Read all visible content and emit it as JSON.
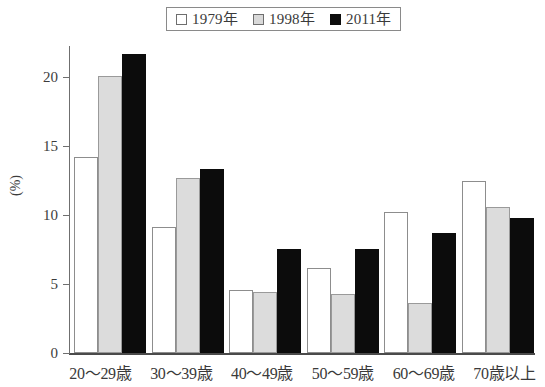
{
  "legend": {
    "position": "top-center",
    "entries": [
      {
        "label": "1979年",
        "swatch": "white-square-icon",
        "color": "#ffffff"
      },
      {
        "label": "1998年",
        "swatch": "gray-square-icon",
        "color": "#dcdcdc"
      },
      {
        "label": "2011年",
        "swatch": "black-square-icon",
        "color": "#0c0c0c"
      }
    ]
  },
  "axes": {
    "y_title": "(%)",
    "y_ticks": [
      "0",
      "5",
      "10",
      "15",
      "20"
    ],
    "x_labels": [
      "20〜29歳",
      "30〜39歳",
      "40〜49歳",
      "50〜59歳",
      "60〜69歳",
      "70歳以上"
    ]
  },
  "chart_data": {
    "type": "bar",
    "title": "",
    "xlabel": "",
    "ylabel": "(%)",
    "ylim": [
      0,
      22.5
    ],
    "yticks": [
      0,
      5,
      10,
      15,
      20
    ],
    "grid": false,
    "legend_position": "top-center",
    "categories": [
      "20〜29歳",
      "30〜39歳",
      "40〜49歳",
      "50〜59歳",
      "60〜69歳",
      "70歳以上"
    ],
    "series": [
      {
        "name": "1979年",
        "color": "#ffffff",
        "values": [
          14.4,
          9.2,
          4.6,
          6.2,
          10.3,
          12.6
        ]
      },
      {
        "name": "1998年",
        "color": "#dcdcdc",
        "values": [
          20.3,
          12.8,
          4.5,
          4.3,
          3.7,
          10.7
        ]
      },
      {
        "name": "2011年",
        "color": "#0c0c0c",
        "values": [
          21.9,
          13.5,
          7.6,
          7.6,
          8.8,
          9.9
        ]
      }
    ]
  }
}
